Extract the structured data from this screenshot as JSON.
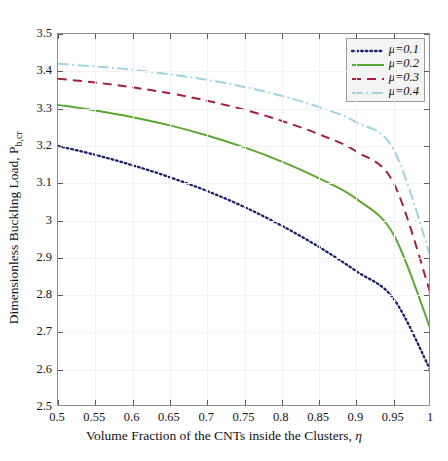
{
  "artifacts": {
    "top_text": "",
    "bottom_text": ""
  },
  "figure": {
    "x_axis_title_prefix": "Volume Fraction of the CNTs inside the Clusters, ",
    "x_axis_title_symbol": "η",
    "y_axis_title_prefix": "Dimensionless Buckling Load, P",
    "y_axis_title_subscript": "b,cr"
  },
  "legend": {
    "position": "top-right",
    "entries": [
      {
        "label": "μ=0.1",
        "color": "#1b1f6b",
        "style": "dotted",
        "name": "mu-0-1"
      },
      {
        "label": "μ=0.2",
        "color": "#5aa832",
        "style": "solid",
        "name": "mu-0-2"
      },
      {
        "label": "μ=0.3",
        "color": "#a41f3e",
        "style": "dashed",
        "name": "mu-0-3"
      },
      {
        "label": "μ=0.4",
        "color": "#9ed3e0",
        "style": "dashdot",
        "name": "mu-0-4"
      }
    ]
  },
  "chart_data": {
    "type": "line",
    "title": "",
    "xlabel": "Volume Fraction of the CNTs inside the Clusters, η",
    "ylabel": "Dimensionless Buckling Load, P_b,cr",
    "xlim": [
      0.5,
      1.0
    ],
    "ylim": [
      2.5,
      3.5
    ],
    "xticks": [
      0.5,
      0.55,
      0.6,
      0.65,
      0.7,
      0.75,
      0.8,
      0.85,
      0.9,
      0.95,
      1
    ],
    "xticklabels": [
      "0.5",
      "0.55",
      "0.6",
      "0.65",
      "0.7",
      "0.75",
      "0.8",
      "0.85",
      "0.9",
      "0.95",
      "1"
    ],
    "yticks": [
      2.5,
      2.6,
      2.7,
      2.8,
      2.9,
      3.0,
      3.1,
      3.2,
      3.3,
      3.4,
      3.5
    ],
    "yticklabels": [
      "2.5",
      "2.6",
      "2.7",
      "2.8",
      "2.9",
      "3",
      "3.1",
      "3.2",
      "3.3",
      "3.4",
      "3.5"
    ],
    "grid": true,
    "legend_position": "upper right",
    "x": [
      0.5,
      0.55,
      0.6,
      0.65,
      0.7,
      0.75,
      0.8,
      0.85,
      0.9,
      0.95,
      1.0
    ],
    "series": [
      {
        "name": "μ=0.1",
        "color": "#1b1f6b",
        "style": "dotted",
        "values": [
          3.2,
          3.176,
          3.148,
          3.116,
          3.079,
          3.036,
          2.986,
          2.929,
          2.864,
          2.79,
          2.595
        ]
      },
      {
        "name": "μ=0.2",
        "color": "#5aa832",
        "style": "solid",
        "values": [
          3.31,
          3.295,
          3.277,
          3.255,
          3.228,
          3.196,
          3.158,
          3.113,
          3.058,
          2.962,
          2.705
        ]
      },
      {
        "name": "μ=0.3",
        "color": "#a41f3e",
        "style": "dashed",
        "values": [
          3.38,
          3.37,
          3.357,
          3.341,
          3.321,
          3.297,
          3.267,
          3.231,
          3.185,
          3.1,
          2.8
        ]
      },
      {
        "name": "μ=0.4",
        "color": "#9ed3e0",
        "style": "dashdot",
        "values": [
          3.42,
          3.413,
          3.404,
          3.392,
          3.377,
          3.358,
          3.334,
          3.304,
          3.264,
          3.19,
          2.9
        ]
      }
    ]
  }
}
